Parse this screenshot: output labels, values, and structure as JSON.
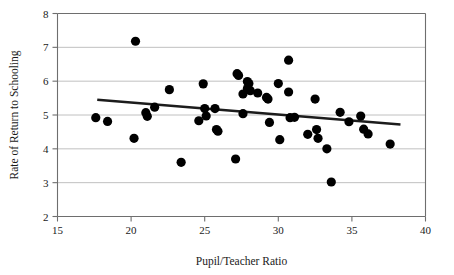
{
  "chart_data": {
    "type": "scatter",
    "title": "",
    "xlabel": "Pupil/Teacher Ratio",
    "ylabel": "Rate of Return to Schooling",
    "xlim": [
      15,
      40
    ],
    "ylim": [
      2,
      8
    ],
    "xticks": [
      15,
      20,
      25,
      30,
      35,
      40
    ],
    "yticks": [
      2,
      3,
      4,
      5,
      6,
      7,
      8
    ],
    "xtick_labels": [
      "15",
      "20",
      "25",
      "30",
      "35",
      "40"
    ],
    "ytick_labels": [
      "2",
      "3",
      "4",
      "5",
      "6",
      "7",
      "8"
    ],
    "grid": "horizontal",
    "legend": "none",
    "marker_color": "#000000",
    "marker_shape": "circle",
    "marker_size_px": 4.6,
    "points": [
      {
        "x": 17.6,
        "y": 4.92
      },
      {
        "x": 18.4,
        "y": 4.81
      },
      {
        "x": 20.2,
        "y": 4.31
      },
      {
        "x": 20.3,
        "y": 7.18
      },
      {
        "x": 21.0,
        "y": 5.07
      },
      {
        "x": 21.1,
        "y": 4.96
      },
      {
        "x": 21.6,
        "y": 5.23
      },
      {
        "x": 22.6,
        "y": 5.75
      },
      {
        "x": 23.4,
        "y": 3.6
      },
      {
        "x": 24.6,
        "y": 4.83
      },
      {
        "x": 24.9,
        "y": 5.92
      },
      {
        "x": 25.0,
        "y": 5.19
      },
      {
        "x": 25.1,
        "y": 4.97
      },
      {
        "x": 25.7,
        "y": 5.19
      },
      {
        "x": 25.8,
        "y": 4.57
      },
      {
        "x": 25.9,
        "y": 4.52
      },
      {
        "x": 27.1,
        "y": 3.7
      },
      {
        "x": 27.2,
        "y": 6.22
      },
      {
        "x": 27.3,
        "y": 6.17
      },
      {
        "x": 27.6,
        "y": 5.62
      },
      {
        "x": 27.6,
        "y": 5.04
      },
      {
        "x": 27.9,
        "y": 5.99
      },
      {
        "x": 27.9,
        "y": 5.78
      },
      {
        "x": 28.0,
        "y": 5.93
      },
      {
        "x": 28.1,
        "y": 5.72
      },
      {
        "x": 28.6,
        "y": 5.65
      },
      {
        "x": 29.2,
        "y": 5.52
      },
      {
        "x": 29.3,
        "y": 5.47
      },
      {
        "x": 29.4,
        "y": 4.78
      },
      {
        "x": 30.0,
        "y": 5.93
      },
      {
        "x": 30.1,
        "y": 4.27
      },
      {
        "x": 30.7,
        "y": 6.62
      },
      {
        "x": 30.7,
        "y": 5.68
      },
      {
        "x": 30.8,
        "y": 4.92
      },
      {
        "x": 31.1,
        "y": 4.93
      },
      {
        "x": 32.0,
        "y": 4.43
      },
      {
        "x": 32.5,
        "y": 5.47
      },
      {
        "x": 32.6,
        "y": 4.57
      },
      {
        "x": 32.7,
        "y": 4.31
      },
      {
        "x": 33.3,
        "y": 4.0
      },
      {
        "x": 33.6,
        "y": 3.02
      },
      {
        "x": 34.2,
        "y": 5.08
      },
      {
        "x": 34.8,
        "y": 4.8
      },
      {
        "x": 35.6,
        "y": 4.97
      },
      {
        "x": 35.8,
        "y": 4.58
      },
      {
        "x": 36.1,
        "y": 4.44
      },
      {
        "x": 37.6,
        "y": 4.14
      }
    ],
    "trend_line": {
      "x_start": 17.7,
      "y_start": 5.45,
      "x_end": 38.3,
      "y_end": 4.72,
      "color": "#1c1c1c"
    }
  }
}
